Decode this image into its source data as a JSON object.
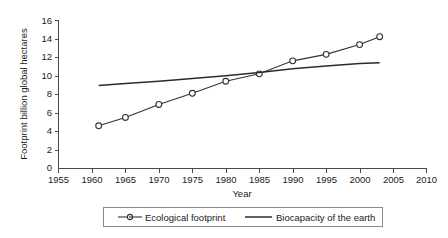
{
  "chart_data": {
    "type": "line",
    "title": "",
    "xlabel": "Year",
    "ylabel": "Footprint billion global hectares",
    "xlim": [
      1955,
      2010
    ],
    "ylim": [
      0,
      16
    ],
    "xticks": [
      1955,
      1960,
      1965,
      1970,
      1975,
      1980,
      1985,
      1990,
      1995,
      2000,
      2005,
      2010
    ],
    "yticks": [
      0,
      2,
      4,
      6,
      8,
      10,
      12,
      14,
      16
    ],
    "grid": false,
    "legend_position": "bottom",
    "series": [
      {
        "name": "Ecological footprint",
        "marker": "open-circle",
        "x": [
          1961,
          1965,
          1970,
          1975,
          1980,
          1985,
          1990,
          1995,
          2000,
          2003
        ],
        "values": [
          4.6,
          5.5,
          6.9,
          8.1,
          9.4,
          10.2,
          11.6,
          12.3,
          13.35,
          14.2
        ]
      },
      {
        "name": "Biocapacity of the earth",
        "marker": "none",
        "x": [
          1961,
          1965,
          1970,
          1975,
          1980,
          1985,
          1990,
          1995,
          2000,
          2003
        ],
        "values": [
          8.95,
          9.15,
          9.4,
          9.7,
          10.0,
          10.35,
          10.75,
          11.05,
          11.3,
          11.4
        ]
      }
    ]
  },
  "axes": {
    "y_title": "Footprint billion global hectares",
    "x_title": "Year",
    "x_tick_labels": [
      "1955",
      "1960",
      "1965",
      "1970",
      "1975",
      "1980",
      "1985",
      "1990",
      "1995",
      "2000",
      "2005",
      "2010"
    ],
    "y_tick_labels": [
      "16",
      "14",
      "12",
      "10",
      "8",
      "6",
      "4",
      "2",
      "0"
    ]
  },
  "legend": {
    "items": [
      {
        "label": "Ecological footprint",
        "marker": "open-circle"
      },
      {
        "label": "Biocapacity of the earth",
        "marker": "line"
      }
    ]
  },
  "colors": {
    "series_footprint": "#333333",
    "series_biocapacity": "#2b2b2b",
    "axis": "#4a4a4a",
    "legend_border": "#8a8a8a",
    "background": "#ffffff"
  }
}
